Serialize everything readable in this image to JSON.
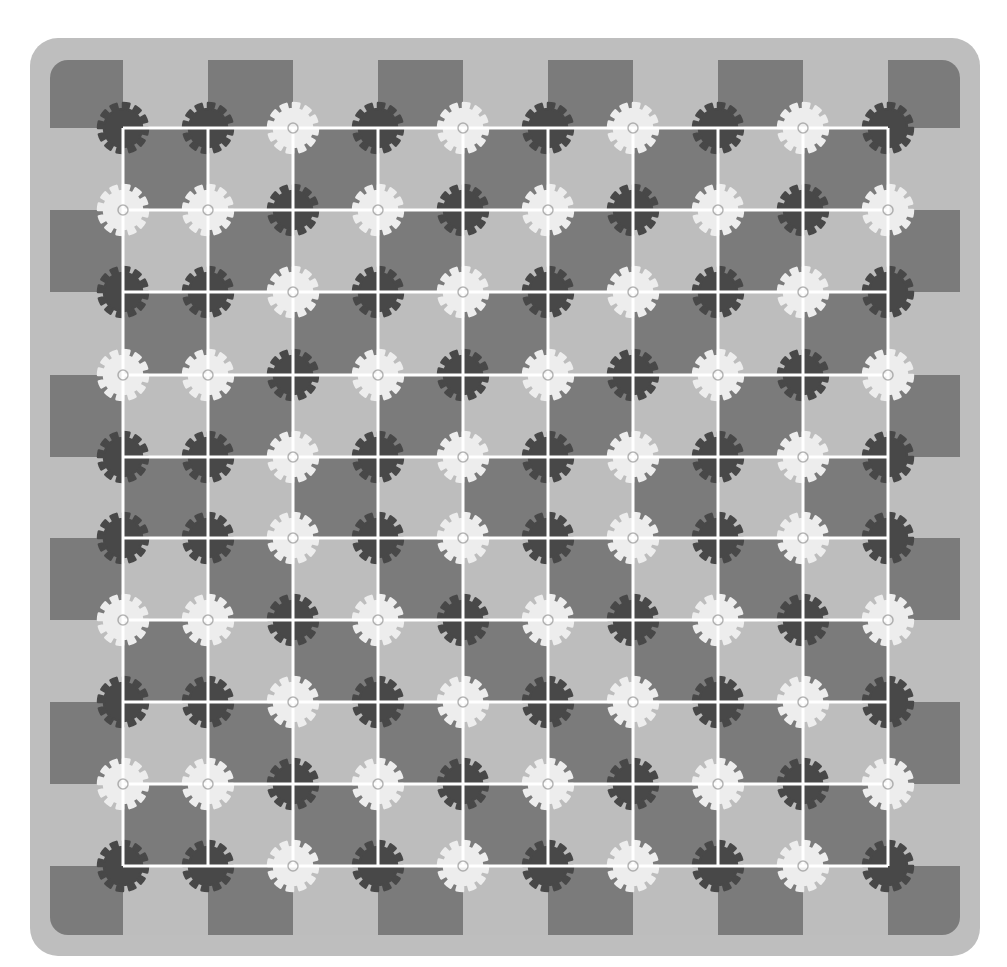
{
  "illusion": {
    "colors": {
      "page_bg": "#ffffff",
      "panel": "#bebebe",
      "checker_dark": "#7b7b7b",
      "checker_light": "#bdbdbd",
      "grid_line": "#ffffff",
      "gear_dark": "#484848",
      "gear_light": "#ededed"
    },
    "panel": {
      "x": 30,
      "y": 38,
      "width": 950,
      "height": 918,
      "radius": 28
    },
    "checker": {
      "x_edges": [
        50,
        123,
        208,
        293,
        378,
        463,
        548,
        633,
        718,
        803,
        888,
        960
      ],
      "y_edges": [
        60,
        128,
        210,
        292,
        375,
        457,
        538,
        620,
        702,
        784,
        866,
        935
      ],
      "corner_radius": 18,
      "first_cell_dark": true
    },
    "grid": {
      "x": [
        123,
        208,
        293,
        378,
        463,
        548,
        633,
        718,
        803,
        888
      ],
      "y": [
        128,
        210,
        292,
        375,
        457,
        538,
        620,
        702,
        784,
        866
      ],
      "line_width": 3
    },
    "gear": {
      "teeth": 12,
      "outer_radius": 25,
      "inner_radius": 19,
      "hole_radius": 3
    },
    "gear_rows": [
      "DDLDLDLDLD",
      "LLDLDLDLDL",
      "DDLDLDLDLD",
      "LLDLDLDLDL",
      "DDLDLDLDLD",
      "DDLDLDLDLD",
      "LLDLDLDLDL",
      "DDLDLDLDLD",
      "LLDLDLDLDL",
      "DDLDLDLDLD"
    ]
  }
}
